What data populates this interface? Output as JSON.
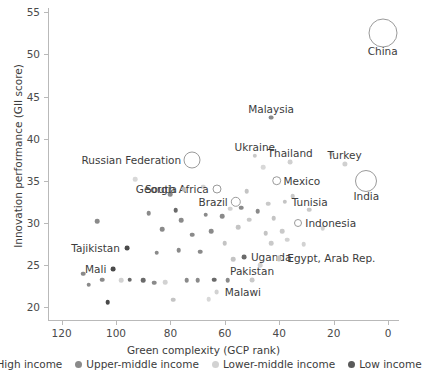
{
  "chart_data": {
    "type": "scatter",
    "title": "",
    "xlabel": "Green complexity (GCP rank)",
    "ylabel": "Innovation performance (GII score)",
    "xlim": [
      125,
      -4
    ],
    "ylim": [
      18.5,
      55.5
    ],
    "x_reversed": true,
    "grid": false,
    "xticks": [
      120,
      100,
      80,
      60,
      40,
      20,
      0
    ],
    "yticks": [
      20,
      25,
      30,
      35,
      40,
      45,
      50,
      55
    ],
    "legend_position": "bottom",
    "legend": [
      {
        "label": "High income",
        "color": "#3d3d3d"
      },
      {
        "label": "Upper-middle income",
        "color": "#8a8a8a"
      },
      {
        "label": "Lower-middle income",
        "color": "#d2d2d2"
      },
      {
        "label": "Low income",
        "color": "#5a5a5a"
      }
    ],
    "bubble_note": "Large open circles are sized by economy size; small filled dots are regular observations",
    "labeled_points": [
      {
        "name": "China",
        "x": 2,
        "y": 52.5,
        "r": 13.5,
        "style": "bubble",
        "label_dx": 0,
        "label_dy": 18,
        "anchor": "mid"
      },
      {
        "name": "Malaysia",
        "x": 43,
        "y": 42.5,
        "r": 2.4,
        "style": "dot",
        "color": "#8a8a8a",
        "label_dx": 0,
        "label_dy": -9,
        "anchor": "mid"
      },
      {
        "name": "Ukraine",
        "x": 49,
        "y": 38.0,
        "r": 2.2,
        "style": "dot",
        "color": "#c9c9c9",
        "label_dx": 0,
        "label_dy": -9,
        "anchor": "mid"
      },
      {
        "name": "Thailand",
        "x": 36,
        "y": 37.2,
        "r": 2.4,
        "style": "dot",
        "color": "#d0d0d0",
        "label_dx": 0,
        "label_dy": -9,
        "anchor": "mid"
      },
      {
        "name": "Turkey",
        "x": 16,
        "y": 37.0,
        "r": 2.6,
        "style": "dot",
        "color": "#d0d0d0",
        "label_dx": 0,
        "label_dy": -9,
        "anchor": "mid"
      },
      {
        "name": "Russian Federation",
        "x": 72,
        "y": 37.5,
        "r": 7.5,
        "style": "bubble",
        "label_dx": -11,
        "label_dy": 0,
        "anchor": "end"
      },
      {
        "name": "Mexico",
        "x": 41,
        "y": 35.0,
        "r": 3.8,
        "style": "bubble",
        "label_dx": 7,
        "label_dy": 0,
        "anchor": "start"
      },
      {
        "name": "India",
        "x": 8,
        "y": 35.0,
        "r": 10.0,
        "style": "bubble",
        "label_dx": 0,
        "label_dy": 15,
        "anchor": "mid"
      },
      {
        "name": "South Africa",
        "x": 63,
        "y": 34.0,
        "r": 3.5,
        "style": "bubble",
        "label_dx": -8,
        "label_dy": 0,
        "anchor": "end"
      },
      {
        "name": "Georgia",
        "x": 75,
        "y": 34.0,
        "r": 2.2,
        "style": "dot",
        "color": "#b9b9b9",
        "label_dx": -7,
        "label_dy": 0,
        "anchor": "end"
      },
      {
        "name": "Brazil",
        "x": 56,
        "y": 32.5,
        "r": 4.2,
        "style": "bubble",
        "label_dx": -8,
        "label_dy": 0,
        "anchor": "end"
      },
      {
        "name": "Tunisia",
        "x": 38,
        "y": 32.5,
        "r": 2.2,
        "style": "dot",
        "color": "#c4c4c4",
        "label_dx": 7,
        "label_dy": 0,
        "anchor": "start"
      },
      {
        "name": "Indonesia",
        "x": 33,
        "y": 30.0,
        "r": 3.0,
        "style": "bubble",
        "label_dx": 7,
        "label_dy": 0,
        "anchor": "start"
      },
      {
        "name": "Tajikistan",
        "x": 96,
        "y": 27.0,
        "r": 2.4,
        "style": "dot",
        "color": "#4a4a4a",
        "label_dx": -7,
        "label_dy": 0,
        "anchor": "end"
      },
      {
        "name": "Uganda",
        "x": 53,
        "y": 26.0,
        "r": 2.4,
        "style": "dot",
        "color": "#6a6a6a",
        "label_dx": 7,
        "label_dy": 0,
        "anchor": "start"
      },
      {
        "name": "Egypt, Arab Rep.",
        "x": 40,
        "y": 25.8,
        "r": 2.6,
        "style": "dot",
        "color": "#c4c4c4",
        "label_dx": 8,
        "label_dy": 0,
        "anchor": "start"
      },
      {
        "name": "Mali",
        "x": 101,
        "y": 24.5,
        "r": 2.4,
        "style": "dot",
        "color": "#4a4a4a",
        "label_dx": -7,
        "label_dy": 0,
        "anchor": "end"
      },
      {
        "name": "Pakistan",
        "x": 50,
        "y": 23.2,
        "r": 2.4,
        "style": "dot",
        "color": "#c9c9c9",
        "label_dx": 0,
        "label_dy": -9,
        "anchor": "mid"
      },
      {
        "name": "Malawi",
        "x": 63,
        "y": 21.8,
        "r": 2.4,
        "style": "dot",
        "color": "#d2d2d2",
        "label_dx": 8,
        "label_dy": 0,
        "anchor": "start"
      }
    ],
    "unlabeled_points": [
      {
        "x": 112,
        "y": 24.0,
        "r": 2.3,
        "color": "#8a8a8a"
      },
      {
        "x": 107,
        "y": 30.2,
        "r": 2.3,
        "color": "#8a8a8a"
      },
      {
        "x": 105,
        "y": 23.3,
        "r": 2.3,
        "color": "#8a8a8a"
      },
      {
        "x": 110,
        "y": 22.7,
        "r": 2.3,
        "color": "#8a8a8a"
      },
      {
        "x": 103,
        "y": 20.6,
        "r": 2.3,
        "color": "#4a4a4a"
      },
      {
        "x": 98,
        "y": 23.2,
        "r": 2.3,
        "color": "#d2d2d2"
      },
      {
        "x": 95,
        "y": 23.3,
        "r": 2.3,
        "color": "#6a6a6a"
      },
      {
        "x": 93,
        "y": 35.2,
        "r": 2.3,
        "color": "#d8d8d8"
      },
      {
        "x": 90,
        "y": 23.2,
        "r": 2.3,
        "color": "#6a6a6a"
      },
      {
        "x": 88,
        "y": 31.2,
        "r": 2.3,
        "color": "#8a8a8a"
      },
      {
        "x": 86,
        "y": 22.9,
        "r": 2.3,
        "color": "#8a8a8a"
      },
      {
        "x": 85,
        "y": 26.5,
        "r": 2.3,
        "color": "#8a8a8a"
      },
      {
        "x": 83,
        "y": 29.3,
        "r": 2.3,
        "color": "#8a8a8a"
      },
      {
        "x": 82,
        "y": 23.0,
        "r": 2.3,
        "color": "#d2d2d2"
      },
      {
        "x": 80,
        "y": 33.4,
        "r": 2.3,
        "color": "#8a8a8a"
      },
      {
        "x": 79,
        "y": 20.9,
        "r": 2.3,
        "color": "#c4c4c4"
      },
      {
        "x": 78,
        "y": 31.5,
        "r": 2.3,
        "color": "#6a6a6a"
      },
      {
        "x": 77,
        "y": 26.8,
        "r": 2.3,
        "color": "#8a8a8a"
      },
      {
        "x": 76,
        "y": 30.3,
        "r": 2.3,
        "color": "#8a8a8a"
      },
      {
        "x": 74,
        "y": 23.2,
        "r": 2.3,
        "color": "#8a8a8a"
      },
      {
        "x": 72,
        "y": 28.6,
        "r": 2.3,
        "color": "#8a8a8a"
      },
      {
        "x": 70,
        "y": 23.2,
        "r": 2.3,
        "color": "#8a8a8a"
      },
      {
        "x": 69,
        "y": 26.6,
        "r": 2.3,
        "color": "#8a8a8a"
      },
      {
        "x": 68,
        "y": 34.3,
        "r": 2.3,
        "color": "#d2d2d2"
      },
      {
        "x": 67,
        "y": 31.0,
        "r": 2.3,
        "color": "#8a8a8a"
      },
      {
        "x": 66,
        "y": 21.0,
        "r": 2.3,
        "color": "#d8d8d8"
      },
      {
        "x": 65,
        "y": 29.0,
        "r": 2.3,
        "color": "#8a8a8a"
      },
      {
        "x": 64,
        "y": 23.3,
        "r": 2.3,
        "color": "#6a6a6a"
      },
      {
        "x": 61,
        "y": 30.8,
        "r": 2.3,
        "color": "#8a8a8a"
      },
      {
        "x": 60,
        "y": 27.6,
        "r": 2.3,
        "color": "#c4c4c4"
      },
      {
        "x": 59,
        "y": 23.2,
        "r": 2.3,
        "color": "#8a8a8a"
      },
      {
        "x": 58,
        "y": 31.7,
        "r": 2.3,
        "color": "#d2d2d2"
      },
      {
        "x": 57,
        "y": 25.7,
        "r": 2.3,
        "color": "#c4c4c4"
      },
      {
        "x": 55,
        "y": 29.5,
        "r": 2.3,
        "color": "#c4c4c4"
      },
      {
        "x": 54,
        "y": 31.8,
        "r": 2.3,
        "color": "#8a8a8a"
      },
      {
        "x": 52,
        "y": 33.8,
        "r": 2.3,
        "color": "#c4c4c4"
      },
      {
        "x": 51,
        "y": 30.4,
        "r": 2.3,
        "color": "#c9c9c9"
      },
      {
        "x": 48,
        "y": 31.4,
        "r": 2.3,
        "color": "#8a8a8a"
      },
      {
        "x": 47,
        "y": 25.0,
        "r": 2.3,
        "color": "#d2d2d2"
      },
      {
        "x": 46,
        "y": 36.6,
        "r": 2.3,
        "color": "#d8d8d8"
      },
      {
        "x": 45,
        "y": 28.8,
        "r": 2.3,
        "color": "#c4c4c4"
      },
      {
        "x": 44,
        "y": 32.3,
        "r": 2.3,
        "color": "#c9c9c9"
      },
      {
        "x": 43,
        "y": 27.6,
        "r": 2.3,
        "color": "#c9c9c9"
      },
      {
        "x": 42,
        "y": 30.6,
        "r": 2.3,
        "color": "#c4c4c4"
      },
      {
        "x": 39,
        "y": 29.0,
        "r": 2.3,
        "color": "#c9c9c9"
      },
      {
        "x": 37,
        "y": 28.0,
        "r": 2.3,
        "color": "#d2d2d2"
      },
      {
        "x": 35,
        "y": 33.2,
        "r": 2.3,
        "color": "#c9c9c9"
      },
      {
        "x": 31,
        "y": 27.5,
        "r": 2.3,
        "color": "#d2d2d2"
      },
      {
        "x": 29,
        "y": 31.6,
        "r": 2.3,
        "color": "#c9c9c9"
      },
      {
        "x": 24,
        "y": 29.4,
        "r": 2.3,
        "color": "#d2d2d2"
      },
      {
        "x": 21,
        "y": 38.2,
        "r": 2.3,
        "color": "#d8d8d8"
      }
    ]
  }
}
